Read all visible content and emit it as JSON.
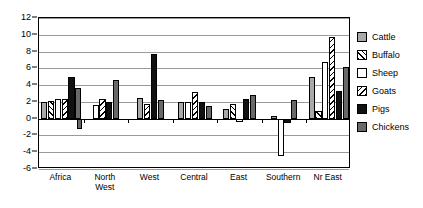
{
  "chart_data": {
    "type": "bar",
    "title": "",
    "xlabel": "",
    "ylabel": "",
    "ylim": [
      -6,
      12
    ],
    "yticks": [
      12,
      10,
      8,
      6,
      4,
      2,
      0,
      -2,
      -4,
      -6
    ],
    "grid": true,
    "legend_position": "right",
    "categories": [
      "Africa",
      "North\nWest",
      "West",
      "Central",
      "East",
      "Southern",
      "Nr East"
    ],
    "series": [
      {
        "name": "Cattle",
        "color": "#a9a9a9",
        "values": [
          2.0,
          0.0,
          2.5,
          2.0,
          1.2,
          0.3,
          5.0
        ]
      },
      {
        "name": "Buffalo",
        "color": "#ffffff",
        "values": [
          2.1,
          0.0,
          0.0,
          0.0,
          1.8,
          0.0,
          0.9
        ]
      },
      {
        "name": "Sheep",
        "color": "#ffffff",
        "values": [
          2.3,
          1.6,
          0.0,
          2.0,
          -0.4,
          -4.5,
          6.7
        ]
      },
      {
        "name": "Goats",
        "color": "#ffffff",
        "values": [
          2.4,
          2.3,
          1.8,
          3.2,
          0.0,
          0.0,
          9.7
        ]
      },
      {
        "name": "Pigs",
        "color": "#111111",
        "values": [
          5.0,
          2.0,
          7.7,
          2.0,
          2.3,
          -0.5,
          3.3
        ]
      },
      {
        "name": "Chickens",
        "color": "#696969",
        "values": [
          3.6,
          4.6,
          2.2,
          1.5,
          2.8,
          2.2,
          6.2
        ]
      }
    ],
    "negative_extras": [
      {
        "category": "Africa",
        "series": "Chickens",
        "value": -1.2
      }
    ]
  },
  "legend": {
    "items": [
      {
        "label": "Cattle",
        "swatch": "cattle-swatch"
      },
      {
        "label": "Buffalo",
        "swatch": "buffalo-swatch"
      },
      {
        "label": "Sheep",
        "swatch": "sheep-swatch"
      },
      {
        "label": "Goats",
        "swatch": "goats-swatch"
      },
      {
        "label": "Pigs",
        "swatch": "pigs-swatch"
      },
      {
        "label": "Chickens",
        "swatch": "chickens-swatch"
      }
    ]
  }
}
